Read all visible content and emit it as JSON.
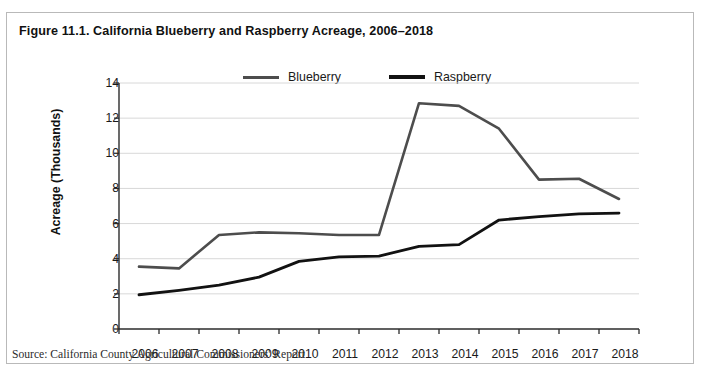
{
  "figure": {
    "title": "Figure 11.1. California Blueberry and Raspberry Acreage, 2006–2018",
    "source": "Source: California County Agricultural Commissioners' Report",
    "border_color": "#b9b9b9",
    "background": "#ffffff"
  },
  "legend": {
    "position": "top-center",
    "entries": [
      {
        "label": "Blueberry",
        "color": "#4d4d4d"
      },
      {
        "label": "Raspberry",
        "color": "#121212"
      }
    ]
  },
  "axes": {
    "y_title": "Acreage (Thousands)",
    "y_ticks": [
      "0",
      "2",
      "4",
      "6",
      "8",
      "10",
      "12",
      "14"
    ],
    "x_ticks": [
      "2006",
      "2007",
      "2008",
      "2009",
      "2010",
      "2011",
      "2012",
      "2013",
      "2014",
      "2015",
      "2016",
      "2017",
      "2018"
    ]
  },
  "chart_data": {
    "type": "line",
    "title": "Figure 11.1. California Blueberry and Raspberry Acreage, 2006–2018",
    "subtitle": "",
    "xlabel": "",
    "ylabel": "Acreage (Thousands)",
    "categories": [
      "2006",
      "2007",
      "2008",
      "2009",
      "2010",
      "2011",
      "2012",
      "2013",
      "2014",
      "2015",
      "2016",
      "2017",
      "2018"
    ],
    "series": [
      {
        "name": "Blueberry",
        "color": "#4d4d4d",
        "values": [
          3.55,
          3.45,
          5.35,
          5.5,
          5.45,
          5.35,
          5.35,
          12.85,
          12.7,
          11.4,
          8.5,
          8.55,
          7.4
        ]
      },
      {
        "name": "Raspberry",
        "color": "#121212",
        "values": [
          1.95,
          2.2,
          2.5,
          2.95,
          3.85,
          4.1,
          4.15,
          4.7,
          4.8,
          6.2,
          6.4,
          6.55,
          6.6
        ]
      }
    ],
    "ylim": [
      0,
      14
    ],
    "ytick_step": 2,
    "grid": "horizontal",
    "legend_position": "top-center",
    "annotations": [],
    "source": "Source: California County Agricultural Commissioners' Report"
  }
}
